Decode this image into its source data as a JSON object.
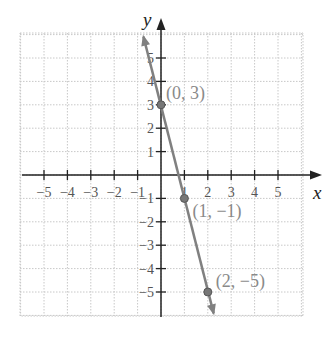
{
  "chart_data": {
    "type": "line",
    "title": "",
    "xlabel": "x",
    "ylabel": "y",
    "xlim": [
      -6,
      6
    ],
    "ylim": [
      -6,
      6
    ],
    "grid": true,
    "x_ticks": [
      -5,
      -4,
      -3,
      -2,
      -1,
      1,
      2,
      3,
      4,
      5
    ],
    "y_ticks": [
      -5,
      -4,
      -3,
      -2,
      -1,
      1,
      2,
      3,
      4,
      5
    ],
    "x_tick_labels": [
      "−5",
      "−4",
      "−3",
      "−2",
      "−1",
      "1",
      "2",
      "3",
      "4",
      "5"
    ],
    "y_tick_labels": [
      "−5",
      "−4",
      "−3",
      "−2",
      "−1",
      "1",
      "2",
      "3",
      "4",
      "5"
    ],
    "series": [
      {
        "name": "y = -4x + 3",
        "x": [
          -0.75,
          0,
          1,
          2,
          2.25
        ],
        "y": [
          6,
          3,
          -1,
          -5,
          -6
        ],
        "color": "#808080"
      }
    ],
    "points": [
      {
        "x": 0,
        "y": 3,
        "label": "(0, 3)"
      },
      {
        "x": 1,
        "y": -1,
        "label": "(1, −1)"
      },
      {
        "x": 2,
        "y": -5,
        "label": "(2, −5)"
      }
    ]
  },
  "axis": {
    "x_name": "x",
    "y_name": "y"
  },
  "colors": {
    "line": "#808080",
    "axis": "#222222",
    "grid": "#c8c8c8",
    "labels": "#8a8a8a"
  }
}
